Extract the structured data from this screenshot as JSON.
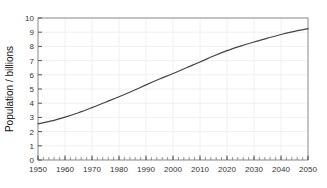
{
  "chart_data": {
    "type": "line",
    "title": "",
    "subtitle": "",
    "xlabel": "",
    "ylabel": "Population / billions",
    "xlim": [
      1950,
      2050
    ],
    "ylim": [
      0,
      10
    ],
    "grid": true,
    "legend": null,
    "x_ticks": [
      1950,
      1960,
      1970,
      1980,
      1990,
      2000,
      2010,
      2020,
      2030,
      2040,
      2050
    ],
    "x_tick_labels": [
      "1950",
      "1960",
      "1970",
      "1980",
      "1990",
      "2000",
      "2010",
      "2020",
      "2030",
      "2040",
      "2050"
    ],
    "x_minor_tick_step": 2,
    "y_ticks": [
      0,
      1,
      2,
      3,
      4,
      5,
      6,
      7,
      8,
      9,
      10
    ],
    "y_tick_labels": [
      "0",
      "1",
      "2",
      "3",
      "4",
      "5",
      "6",
      "7",
      "8",
      "9",
      "10"
    ],
    "series": [
      {
        "name": "World population",
        "color": "#444444",
        "x": [
          1950,
          1955,
          1960,
          1965,
          1970,
          1975,
          1980,
          1985,
          1990,
          1995,
          2000,
          2005,
          2010,
          2015,
          2020,
          2025,
          2030,
          2035,
          2040,
          2045,
          2050
        ],
        "values": [
          2.55,
          2.75,
          3.02,
          3.33,
          3.69,
          4.07,
          4.45,
          4.86,
          5.29,
          5.7,
          6.09,
          6.5,
          6.9,
          7.32,
          7.7,
          8.02,
          8.31,
          8.58,
          8.84,
          9.06,
          9.25
        ]
      }
    ]
  },
  "axes": {
    "y_title": "Population / billions"
  }
}
